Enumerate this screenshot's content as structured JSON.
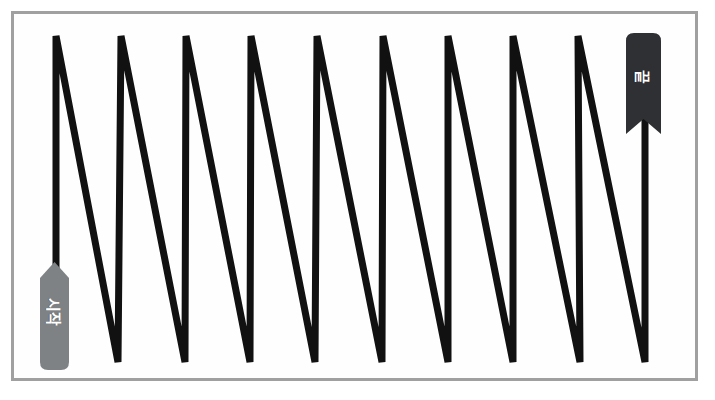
{
  "figure": {
    "title": "",
    "background_color": "#ffffff",
    "frame": {
      "border_color": "#a0a0a0",
      "fill_color": "#fefefe",
      "border_width": 3
    }
  },
  "path": {
    "name": "serpentine-zigzag-path",
    "stroke_color": "#111111",
    "stroke_width": 7,
    "direction": "left-to-right",
    "peak_count": 9,
    "valley_count": 9,
    "top_y": 36,
    "bottom_y": 362,
    "points": [
      [
        56,
        362
      ],
      [
        56,
        36
      ],
      [
        118,
        362
      ],
      [
        121,
        36
      ],
      [
        185,
        362
      ],
      [
        186,
        36
      ],
      [
        250,
        362
      ],
      [
        251,
        36
      ],
      [
        315,
        362
      ],
      [
        317,
        36
      ],
      [
        382,
        362
      ],
      [
        383,
        36
      ],
      [
        448,
        362
      ],
      [
        448,
        36
      ],
      [
        513,
        362
      ],
      [
        513,
        36
      ],
      [
        580,
        362
      ],
      [
        578,
        36
      ],
      [
        645,
        362
      ],
      [
        645,
        60
      ]
    ]
  },
  "labels": {
    "start": {
      "text": "시작",
      "icon": "start-pin-icon",
      "fill_color": "#7f8285",
      "text_color": "#ffffff",
      "shape": "rounded-pin",
      "x": 36,
      "y": 262,
      "width": 37,
      "height": 108
    },
    "end": {
      "text": "끝",
      "icon": "end-ribbon-icon",
      "fill_color": "#2f3033",
      "text_color": "#ffffff",
      "shape": "ribbon-bookmark",
      "x": 626,
      "y": 33,
      "width": 35,
      "height": 101
    }
  },
  "chart_data": {
    "type": "line",
    "title": "",
    "xlabel": "",
    "ylabel": "",
    "grid": false,
    "legend_position": "none",
    "annotations": [
      "시작",
      "끝"
    ],
    "series": [
      {
        "name": "serpentine-scan-path",
        "x": [
          56,
          56,
          118,
          121,
          185,
          186,
          250,
          251,
          315,
          317,
          382,
          383,
          448,
          448,
          513,
          513,
          580,
          578,
          645,
          645
        ],
        "y": [
          362,
          36,
          362,
          36,
          362,
          36,
          362,
          36,
          362,
          36,
          362,
          36,
          362,
          36,
          362,
          36,
          362,
          36,
          362,
          60
        ]
      }
    ],
    "xlim": [
      11,
      701
    ],
    "ylim": [
      381,
      11
    ]
  }
}
